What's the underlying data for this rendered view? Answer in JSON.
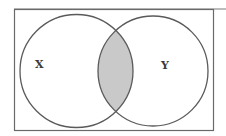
{
  "diagram": {
    "type": "venn",
    "sets": [
      {
        "label": "X",
        "cx": 76.5,
        "cy": 71,
        "r": 56.5
      },
      {
        "label": "Y",
        "cx": 153,
        "cy": 71,
        "r": 55
      }
    ],
    "shaded_region": "X ∩ Y",
    "colors": {
      "stroke": "#5a5a5a",
      "shade": "#c8c8c8",
      "background": "#ffffff",
      "frame": "#6a6a6a"
    }
  }
}
